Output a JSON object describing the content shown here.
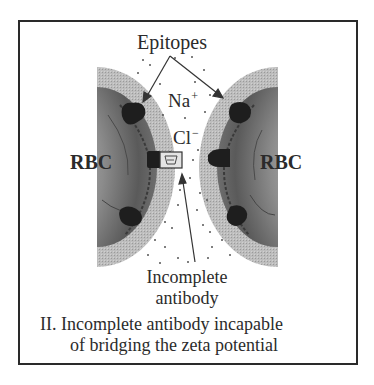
{
  "figure": {
    "labels": {
      "epitopes": "Epitopes",
      "sodium": "Na",
      "sodium_charge": "+",
      "chloride": "Cl",
      "chloride_charge": "−",
      "rbc_left": "RBC",
      "rbc_right": "RBC",
      "antibody_line1": "Incomplete",
      "antibody_line2": "antibody"
    },
    "caption": {
      "line1": "II. Incomplete antibody incapable",
      "line2": "of bridging the zeta potential"
    },
    "colors": {
      "frame": "#2a2a2a",
      "zeta_halo": "#b8b8b8",
      "cell_body": "#7a7a7a",
      "epitope": "#1e1e1e",
      "antibody_fill": "#e4e4e4",
      "text": "#2b2b2b"
    },
    "icons": {
      "left_rbc": "red-blood-cell-left-half",
      "right_rbc": "red-blood-cell-right-half",
      "epitope": "epitope-blob",
      "antibody": "incomplete-antibody-box",
      "ion_dots": "ion-dots"
    }
  }
}
